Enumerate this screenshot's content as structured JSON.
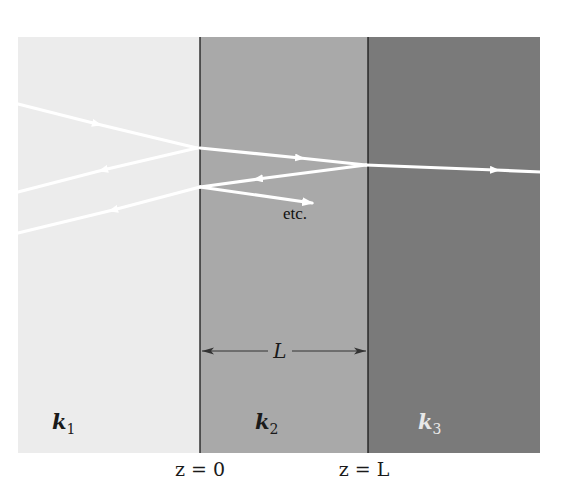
{
  "diagram": {
    "type": "three-layer wave reflection/transmission",
    "colors": {
      "medium1": "#ececec",
      "medium2": "#a9a9a9",
      "medium3": "#7a7a7a",
      "ray": "#ffffff",
      "boundary": "#1a1a1a",
      "background": "#ffffff"
    },
    "media": [
      {
        "id": "medium1",
        "label": "k",
        "subscript": "1"
      },
      {
        "id": "medium2",
        "label": "k",
        "subscript": "2"
      },
      {
        "id": "medium3",
        "label": "k",
        "subscript": "3"
      }
    ],
    "boundaries": [
      {
        "label": "z = 0"
      },
      {
        "label": "z = L"
      }
    ],
    "dimension": {
      "label": "L"
    },
    "annotation": "etc."
  }
}
